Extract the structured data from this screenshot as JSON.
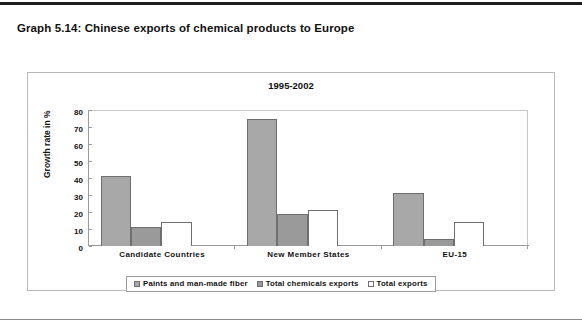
{
  "figure": {
    "caption": "Graph 5.14: Chinese exports of chemical products to Europe"
  },
  "chart_data": {
    "type": "bar",
    "title": "1995-2002",
    "xlabel": "",
    "ylabel": "Growth rate in %",
    "ylim": [
      0,
      80
    ],
    "yticks": [
      80,
      70,
      60,
      50,
      40,
      30,
      20,
      10,
      0
    ],
    "grid": false,
    "legend_position": "bottom",
    "categories": [
      "Candidate Countries",
      "New Member States",
      "EU-15"
    ],
    "series": [
      {
        "name": "Paints and man-made fiber",
        "color": "#a8a8a8",
        "values": [
          41,
          75,
          31
        ]
      },
      {
        "name": "Total chemicals exports",
        "color": "#9a9a9a",
        "values": [
          11,
          19,
          4
        ]
      },
      {
        "name": "Total exports",
        "color": "#ffffff",
        "values": [
          14,
          21,
          14
        ]
      }
    ]
  }
}
